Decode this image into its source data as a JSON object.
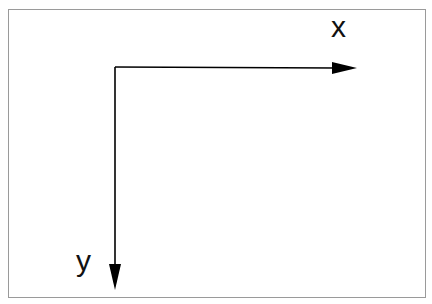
{
  "diagram": {
    "type": "coordinate-axes",
    "x_axis": {
      "label": "x",
      "direction": "right"
    },
    "y_axis": {
      "label": "y",
      "direction": "down"
    },
    "colors": {
      "axis": "#000000",
      "frame": "#9a9a9a",
      "background": "#ffffff"
    }
  }
}
